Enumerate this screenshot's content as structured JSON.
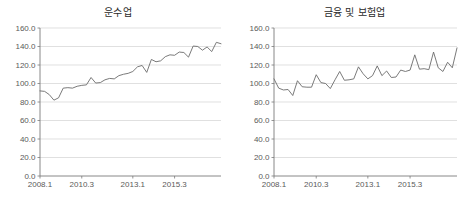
{
  "figure": {
    "background": "#ffffff",
    "line_color": "#6b6b6b",
    "grid_color": "#d2d2d2",
    "axis_color": "#7a7a7a"
  },
  "chart_data": [
    {
      "type": "line",
      "title": "운수업",
      "xlabel": "",
      "ylabel": "",
      "ylim": [
        0,
        160
      ],
      "yticks": [
        "0.0",
        "20.0",
        "40.0",
        "60.0",
        "80.0",
        "100.0",
        "120.0",
        "140.0",
        "160.0"
      ],
      "ytick_values": [
        0,
        20,
        40,
        60,
        80,
        100,
        120,
        140,
        160
      ],
      "xticks": [
        "2008.1",
        "2010.3",
        "2013.1",
        "2015.3"
      ],
      "xtick_index": [
        0,
        9,
        20,
        29
      ],
      "grid": true,
      "legend": "none",
      "x": [
        "2008.1",
        "2008.2",
        "2008.3",
        "2008.4",
        "2009.1",
        "2009.2",
        "2009.3",
        "2009.4",
        "2010.1",
        "2010.3",
        "2010.4",
        "2011.1",
        "2011.2",
        "2011.3",
        "2011.4",
        "2012.1",
        "2012.2",
        "2012.3",
        "2012.4",
        "2013.1",
        "2013.2",
        "2013.3",
        "2013.4",
        "2014.1",
        "2014.2",
        "2014.3",
        "2014.4",
        "2015.1",
        "2015.2",
        "2015.3",
        "2015.4",
        "2016.1",
        "2016.2",
        "2016.3",
        "2016.4",
        "2017.1",
        "2017.2",
        "2017.3",
        "2017.4",
        "2018.1"
      ],
      "values": [
        92.0,
        91.5,
        88.0,
        82.0,
        84.5,
        95.0,
        95.5,
        95.0,
        97.0,
        98.0,
        98.5,
        106.5,
        100.5,
        101.0,
        104.0,
        105.5,
        105.0,
        108.5,
        110.0,
        111.0,
        113.0,
        118.0,
        119.5,
        112.0,
        126.0,
        123.5,
        124.5,
        129.0,
        131.0,
        130.5,
        134.0,
        133.5,
        128.5,
        140.5,
        140.0,
        136.0,
        139.5,
        134.5,
        144.5,
        143.0
      ]
    },
    {
      "type": "line",
      "title": "금융 및 보험업",
      "xlabel": "",
      "ylabel": "",
      "ylim": [
        0,
        160
      ],
      "yticks": [
        "0.0",
        "20.0",
        "40.0",
        "60.0",
        "80.0",
        "100.0",
        "120.0",
        "140.0",
        "160.0"
      ],
      "ytick_values": [
        0,
        20,
        40,
        60,
        80,
        100,
        120,
        140,
        160
      ],
      "xticks": [
        "2008.1",
        "2010.3",
        "2013.1",
        "2015.3"
      ],
      "xtick_index": [
        0,
        9,
        20,
        29
      ],
      "grid": true,
      "legend": "none",
      "x": [
        "2008.1",
        "2008.2",
        "2008.3",
        "2008.4",
        "2009.1",
        "2009.2",
        "2009.3",
        "2009.4",
        "2010.1",
        "2010.3",
        "2010.4",
        "2011.1",
        "2011.2",
        "2011.3",
        "2011.4",
        "2012.1",
        "2012.2",
        "2012.3",
        "2012.4",
        "2013.1",
        "2013.2",
        "2013.3",
        "2013.4",
        "2014.1",
        "2014.2",
        "2014.3",
        "2014.4",
        "2015.1",
        "2015.2",
        "2015.3",
        "2015.4",
        "2016.1",
        "2016.2",
        "2016.3",
        "2016.4",
        "2017.1",
        "2017.2",
        "2017.3",
        "2017.4",
        "2018.1"
      ],
      "values": [
        105.0,
        95.0,
        93.0,
        93.5,
        87.0,
        103.0,
        96.5,
        96.0,
        96.0,
        109.5,
        101.0,
        100.0,
        94.5,
        104.0,
        113.0,
        103.5,
        104.0,
        105.0,
        118.0,
        110.5,
        105.0,
        108.5,
        119.0,
        108.5,
        113.5,
        106.5,
        107.0,
        114.5,
        113.0,
        114.5,
        131.0,
        115.5,
        116.0,
        115.0,
        134.0,
        117.0,
        113.0,
        123.0,
        117.0,
        138.5
      ]
    }
  ]
}
